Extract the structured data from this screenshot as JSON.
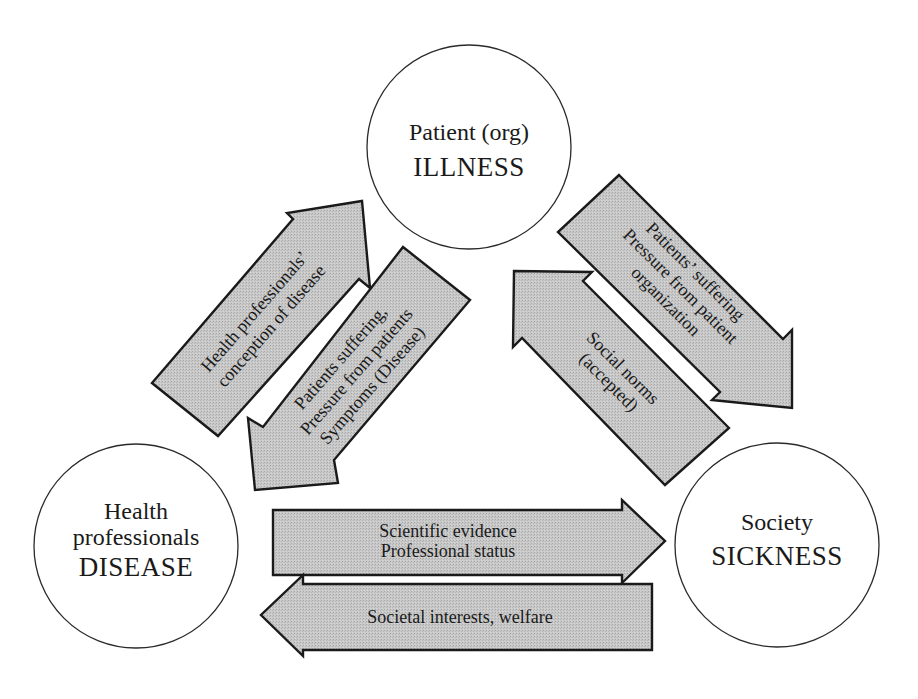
{
  "diagram": {
    "nodes": {
      "patient": {
        "line1": "Patient (org)",
        "line2": "ILLNESS"
      },
      "health_professionals": {
        "line1": "Health",
        "line2": "professionals",
        "line3": "DISEASE"
      },
      "society": {
        "line1": "Society",
        "line2": "SICKNESS"
      }
    },
    "arrows": {
      "hp_to_patient": {
        "line1": "Health professionals’",
        "line2": "conception of disease"
      },
      "patient_to_hp": {
        "line1": "Patients suffering,",
        "line2": "Pressure from patients",
        "line3": "Symptoms (Disease)"
      },
      "patient_to_society": {
        "line1": "Patients’ suffering",
        "line2": "Pressure from patient",
        "line3": "organization"
      },
      "society_to_patient": {
        "line1": "Social norms",
        "line2": "(accepted)"
      },
      "hp_to_society": {
        "line1": "Scientific evidence",
        "line2": "Professional status"
      },
      "society_to_hp": {
        "line1": "Societal interests, welfare"
      }
    },
    "colors": {
      "arrow_fill": "#c4c4c4",
      "arrow_stroke": "#1a1a1a",
      "circle_stroke": "#2a2a2a",
      "background": "#ffffff"
    }
  }
}
